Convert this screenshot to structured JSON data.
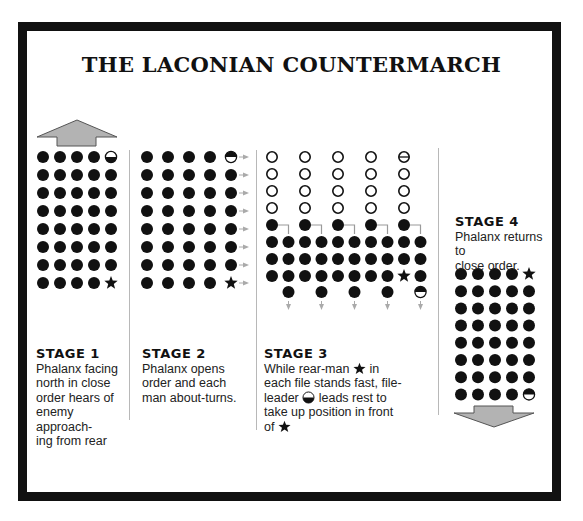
{
  "title": "THE LACONIAN COUNTERMARCH",
  "colors": {
    "frame": "#111111",
    "soldier": "#111111",
    "arrow_fill": "#b3b3b3",
    "arrow_stroke": "#555555",
    "divider": "#b8b8b8",
    "connector": "#9a9a9a"
  },
  "legend": {
    "filled-circle": "soldier",
    "star": "rear-man",
    "half-circle": "file-leader",
    "hollow-circle": "original position (vacated)"
  },
  "stages": [
    {
      "heading": "STAGE  1",
      "lines": [
        "Phalanx facing",
        "north in close",
        "order hears of",
        "enemy approach-",
        "ing from rear"
      ],
      "formation": {
        "rows": 8,
        "cols": 5,
        "file_leader": "top-right (half circle, dark bottom)",
        "rear_man": "bottom-right (star)"
      },
      "arrow": "up"
    },
    {
      "heading": "STAGE  2",
      "lines": [
        "Phalanx opens",
        "order and each",
        "man about-turns."
      ],
      "formation": {
        "rows": 8,
        "cols": 5,
        "file_leader": "top-right (half circle, dark top)",
        "rear_man": "bottom-right (star)"
      },
      "arrow": "right (per rank)"
    },
    {
      "heading": "STAGE  3",
      "lines_parts": {
        "l1a": "While rear-man",
        "l1b": " in",
        "l2": "each file stands fast, file-",
        "l3a": "leader",
        "l3b": " leads rest to",
        "l4": "take up position in front",
        "l5": "of"
      },
      "formation": {
        "hollow_rows": 4,
        "cols": 5,
        "moving_rows": 3,
        "moving_cols": 10
      },
      "arrow": "down"
    },
    {
      "heading": "STAGE  4",
      "lines": [
        "Phalanx returns to",
        "close order."
      ],
      "formation": {
        "rows": 8,
        "cols": 5,
        "rear_man": "top-right (star)",
        "file_leader": "bottom-right (half circle)"
      },
      "arrow": "down"
    }
  ]
}
